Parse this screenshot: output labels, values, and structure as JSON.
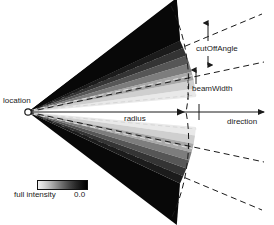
{
  "figure": {
    "type": "spotlight-cone-diagram",
    "background_color": "#ffffff",
    "line_color": "#1a1a1a",
    "labels": {
      "location": "location",
      "cut_off_angle": "cutOffAngle",
      "beam_width": "beamWidth",
      "radius": "radius",
      "direction": "direction"
    },
    "legend": {
      "full_intensity_label": "full intensity",
      "zero_label": "0.0",
      "gradient_from": "#f2f2f2",
      "gradient_to": "#000000"
    },
    "geometry": {
      "apex_x": 28,
      "apex_y": 112,
      "axis_end_x": 268,
      "radius_tick_x": 185,
      "cut_off_angle_deg": 38,
      "beam_width_deg": 22
    },
    "intensity_bands": [
      {
        "name": "band-full",
        "color": "#e9e9e9"
      },
      {
        "name": "band-1",
        "color": "#cfcfcf"
      },
      {
        "name": "band-2",
        "color": "#a8a8a8"
      },
      {
        "name": "band-3",
        "color": "#7d7d7d"
      },
      {
        "name": "band-4",
        "color": "#565656"
      },
      {
        "name": "band-5",
        "color": "#343434"
      },
      {
        "name": "band-6",
        "color": "#1b1b1b"
      },
      {
        "name": "band-zero",
        "color": "#060606"
      }
    ]
  }
}
